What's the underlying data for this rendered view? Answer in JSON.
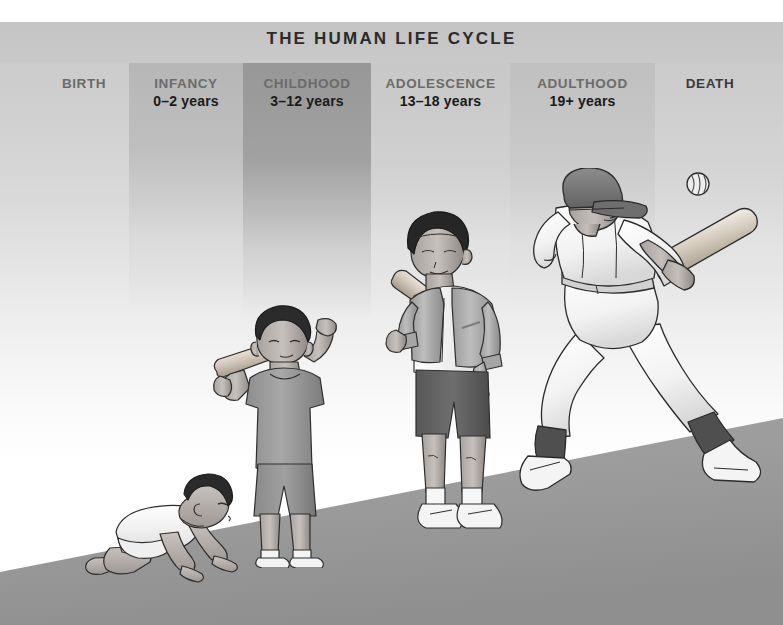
{
  "title": "THE HUMAN LIFE CYCLE",
  "stages": [
    {
      "label": "BIRTH",
      "age": "",
      "band": "none"
    },
    {
      "label": "INFANCY",
      "age": "0–2 years",
      "band": "light"
    },
    {
      "label": "CHILDHOOD",
      "age": "3–12 years",
      "band": "dark"
    },
    {
      "label": "ADOLESCENCE",
      "age": "13–18 years",
      "band": "light"
    },
    {
      "label": "ADULTHOOD",
      "age": "19+ years",
      "band": "light"
    },
    {
      "label": "DEATH",
      "age": "",
      "band": "light"
    }
  ],
  "figures": [
    {
      "name": "crawling-baby",
      "stage": "INFANCY",
      "description": "infant crawling on hands and knees wearing a white onesie"
    },
    {
      "name": "child-with-bat",
      "stage": "CHILDHOOD",
      "description": "young boy standing holding a baseball bat over his shoulder, gray t-shirt and shorts, sneakers"
    },
    {
      "name": "teen-with-bat",
      "stage": "ADOLESCENCE",
      "description": "teenage boy in varsity jacket and shorts with bat over shoulder holding a baseball"
    },
    {
      "name": "adult-batter",
      "stage": "ADULTHOOD",
      "description": "adult baseball player in uniform and cap swinging a bat"
    },
    {
      "name": "baseball",
      "stage": "ADULTHOOD",
      "description": "baseball in mid air"
    }
  ],
  "colors": {
    "title_text": "#2b2b2b",
    "stage_label": "#6b6b6b",
    "age_text": "#1a1a1a",
    "header_band": "#c6c6c6",
    "band_dark": "#969696",
    "band_light": "#b5b5b5",
    "ground": "#9a9a9a"
  }
}
